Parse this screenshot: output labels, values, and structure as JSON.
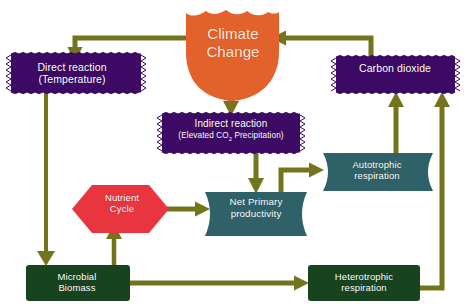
{
  "diagram": {
    "title_node": {
      "id": "climate-change",
      "label": "Climate Change",
      "line1": "Climate",
      "line2": "Change",
      "shape": "shield",
      "color": "#E3622C"
    },
    "nodes": [
      {
        "id": "direct-reaction",
        "line1": "Direct reaction",
        "line2": "(Temperature)",
        "shape": "jagged-rectangle",
        "color": "#3C0A64"
      },
      {
        "id": "indirect-reaction",
        "line1": "Indirect reaction",
        "line2_pre": "(Elevated CO",
        "line2_sub": "2",
        "line2_post": " Precipitation)",
        "shape": "jagged-rectangle",
        "color": "#3C0A64"
      },
      {
        "id": "carbon-dioxide",
        "line1": "Carbon dioxide",
        "line2": "",
        "shape": "jagged-rectangle",
        "color": "#3C0A64"
      },
      {
        "id": "nutrient-cycle",
        "line1": "Nutrient",
        "line2": "Cycle",
        "shape": "hexagon",
        "color": "#E8353F"
      },
      {
        "id": "net-primary-productivity",
        "line1": "Net Primary",
        "line2": "productivity",
        "shape": "concave-ribbon",
        "color": "#2F6268"
      },
      {
        "id": "autotrophic-respiration",
        "line1": "Autotrophic",
        "line2": "respiration",
        "shape": "concave-ribbon",
        "color": "#2F6268"
      },
      {
        "id": "microbial-biomass",
        "line1": "Microbial",
        "line2": "Biomass",
        "shape": "rounded-rectangle",
        "color": "#17441F"
      },
      {
        "id": "heterotrophic-respiration",
        "line1": "Heterotrophic",
        "line2": "respiration",
        "shape": "rounded-rectangle",
        "color": "#17441F"
      }
    ],
    "connectors": [
      {
        "id": "climate-to-direct",
        "from": "climate-change",
        "to": "direct-reaction"
      },
      {
        "id": "climate-to-indirect",
        "from": "climate-change",
        "to": "indirect-reaction"
      },
      {
        "id": "co2-to-climate",
        "from": "carbon-dioxide",
        "to": "climate-change"
      },
      {
        "id": "direct-to-microbial",
        "from": "direct-reaction",
        "to": "microbial-biomass"
      },
      {
        "id": "indirect-to-npp",
        "from": "indirect-reaction",
        "to": "net-primary-productivity"
      },
      {
        "id": "nutrient-to-npp",
        "from": "nutrient-cycle",
        "to": "net-primary-productivity"
      },
      {
        "id": "microbial-to-nutrient",
        "from": "microbial-biomass",
        "to": "nutrient-cycle"
      },
      {
        "id": "npp-to-autotrophic",
        "from": "net-primary-productivity",
        "to": "autotrophic-respiration"
      },
      {
        "id": "autotrophic-to-co2",
        "from": "autotrophic-respiration",
        "to": "carbon-dioxide"
      },
      {
        "id": "microbial-to-heterotrophic",
        "from": "microbial-biomass",
        "to": "heterotrophic-respiration"
      },
      {
        "id": "heterotrophic-to-co2",
        "from": "heterotrophic-respiration",
        "to": "carbon-dioxide"
      }
    ],
    "colors": {
      "arrow": "#73741B",
      "orange": "#E3622C",
      "purple": "#3C0A64",
      "red": "#E8353F",
      "teal": "#2F6268",
      "dark_green": "#17441F",
      "background": "#FFFFFF"
    }
  }
}
